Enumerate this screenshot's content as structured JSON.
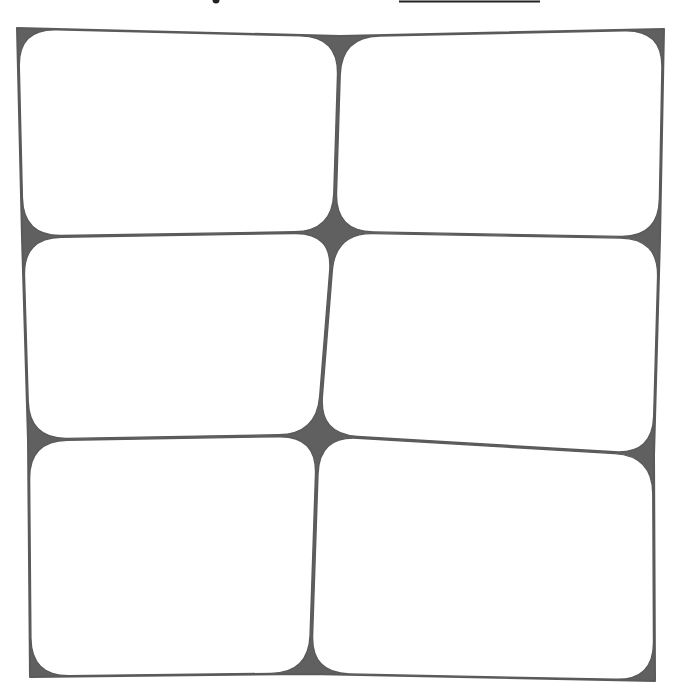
{
  "drawing": {
    "title": "Hand-drawn six-cell grid",
    "medium": "pencil sketch",
    "width": 684,
    "height": 698,
    "background": "#ffffff",
    "stroke_color": "#5a5a5a",
    "fill_color": "#606060",
    "rows": 3,
    "columns": 2
  },
  "top_fragments": {
    "dot": {
      "cx": 216,
      "cy": 0,
      "r": 3.5
    },
    "underline": {
      "x1": 399,
      "x2": 540,
      "y": 1.5,
      "stroke_width": 2
    }
  },
  "junctions": {
    "top_left": [
      17,
      28
    ],
    "top_mid": [
      340,
      36
    ],
    "top_right": [
      664,
      29
    ],
    "mid1_left": [
      22,
      237
    ],
    "mid1_center": [
      334,
      232
    ],
    "mid1_right": [
      660,
      238
    ],
    "mid2_left": [
      28,
      440
    ],
    "mid2_center": [
      318,
      435
    ],
    "mid2_right": [
      654,
      455
    ],
    "bottom_left": [
      30,
      677
    ],
    "bottom_mid": [
      310,
      674
    ],
    "bottom_right": [
      655,
      681
    ]
  },
  "cells": [
    {
      "id": "cell-1",
      "row": 1,
      "col": 1,
      "corners": [
        "top_left",
        "top_mid",
        "mid1_center",
        "mid1_left"
      ]
    },
    {
      "id": "cell-2",
      "row": 1,
      "col": 2,
      "corners": [
        "top_mid",
        "top_right",
        "mid1_right",
        "mid1_center"
      ]
    },
    {
      "id": "cell-3",
      "row": 2,
      "col": 1,
      "corners": [
        "mid1_left",
        "mid1_center",
        "mid2_center",
        "mid2_left"
      ]
    },
    {
      "id": "cell-4",
      "row": 2,
      "col": 2,
      "corners": [
        "mid1_center",
        "mid1_right",
        "mid2_right",
        "mid2_center"
      ]
    },
    {
      "id": "cell-5",
      "row": 3,
      "col": 1,
      "corners": [
        "mid2_left",
        "mid2_center",
        "bottom_mid",
        "bottom_left"
      ]
    },
    {
      "id": "cell-6",
      "row": 3,
      "col": 2,
      "corners": [
        "mid2_center",
        "mid2_right",
        "bottom_right",
        "bottom_mid"
      ]
    }
  ],
  "corner_radius": 38
}
